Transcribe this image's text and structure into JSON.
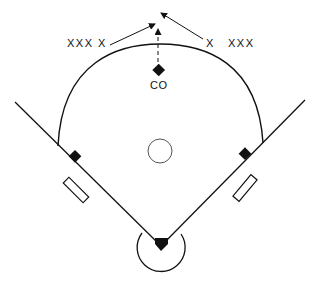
{
  "diagram": {
    "left_players": "XXX X",
    "right_runner": "X",
    "right_players": "XXX",
    "center_label": "CO",
    "colors": {
      "line": "#111111",
      "fill": "#111111",
      "background": "#ffffff"
    }
  }
}
